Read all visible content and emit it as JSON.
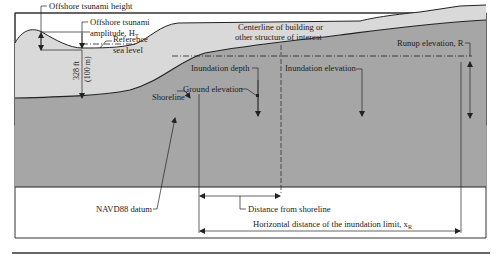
{
  "diagram": {
    "labels": {
      "offshore_height": "Offshore tsunami height",
      "offshore_amplitude_line1": "Offshore tsunami",
      "offshore_amplitude_line2": "amplitude, H",
      "offshore_amplitude_sub": "T",
      "reference_line1": "Reference",
      "reference_line2": "sea level",
      "shoreline": "Shoreline",
      "centerline_line1": "Centerline of building or",
      "centerline_line2": "other structure of interest",
      "inundation_depth": "Inundation depth",
      "ground_elevation": "Ground elevation",
      "inundation_elevation": "Inundation elevation",
      "runup_elevation": "Runup elevation, R",
      "depth_dim_line1": "328 ft",
      "depth_dim_line2": "(100 m)",
      "navd88": "NAVD88 datum",
      "distance_from_shoreline": "Distance from shoreline",
      "horizontal_distance": "Horizontal distance of the inundation limit, x",
      "horizontal_distance_sub": "R"
    },
    "colors": {
      "water": "#d9d9d9",
      "ground": "#a6a6a6",
      "outline": "#222222",
      "frame": "#333333"
    }
  }
}
